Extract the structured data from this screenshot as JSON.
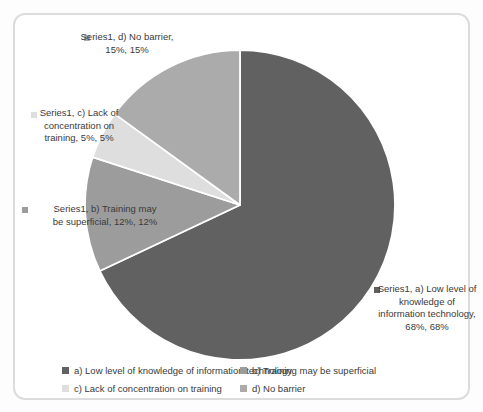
{
  "chart_data": {
    "type": "pie",
    "title": "",
    "series_name": "Series1",
    "categories": [
      "a) Low level of knowledge of information technology",
      "b) Training may be superficial",
      "c) Lack of concentration on training",
      "d) No barrier"
    ],
    "values": [
      68,
      12,
      5,
      15
    ],
    "unit": "%",
    "slice_order_clockwise_from_top": [
      "a",
      "b",
      "c",
      "d"
    ],
    "colors": {
      "a": "#616161",
      "b": "#9c9c9c",
      "c": "#dedede",
      "d": "#ababab"
    },
    "slice_border_color": "#ffffff",
    "legend_position": "bottom",
    "data_labels_format": "series name, category name, value, percentage"
  },
  "data_labels": {
    "a": {
      "lines": [
        "Series1, a) Low level of",
        "knowledge of",
        "information technology,",
        "68%, 68%"
      ]
    },
    "b": {
      "lines": [
        "Series1, b) Training may",
        "be superficial, 12%, 12%"
      ]
    },
    "c": {
      "lines": [
        "Series1, c) Lack of",
        "concentration on",
        "training, 5%, 5%"
      ]
    },
    "d": {
      "lines": [
        "Series1, d) No barrier,",
        "15%, 15%"
      ]
    }
  },
  "legend": {
    "items": [
      {
        "key": "a",
        "label": "a) Low level of knowledge of information technology"
      },
      {
        "key": "b",
        "label": "b) Training may be superficial"
      },
      {
        "key": "c",
        "label": "c) Lack of concentration on training"
      },
      {
        "key": "d",
        "label": "d) No barrier"
      }
    ]
  }
}
